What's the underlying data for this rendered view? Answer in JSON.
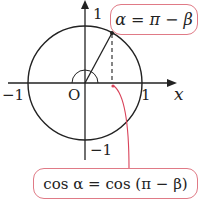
{
  "diagram": {
    "type": "unit-circle",
    "axes": {
      "x_label": "x",
      "origin_label": "O",
      "x_pos_tick": "1",
      "x_neg_tick": "−1",
      "y_pos_tick": "1",
      "y_neg_tick": "−1"
    },
    "callout_top": {
      "text": "α = π − β"
    },
    "callout_bottom": {
      "text": "cos α = cos (π − β)"
    },
    "colors": {
      "line": "#222222",
      "accent": "#e07a86",
      "callout_arrow": "#d9435a"
    }
  }
}
